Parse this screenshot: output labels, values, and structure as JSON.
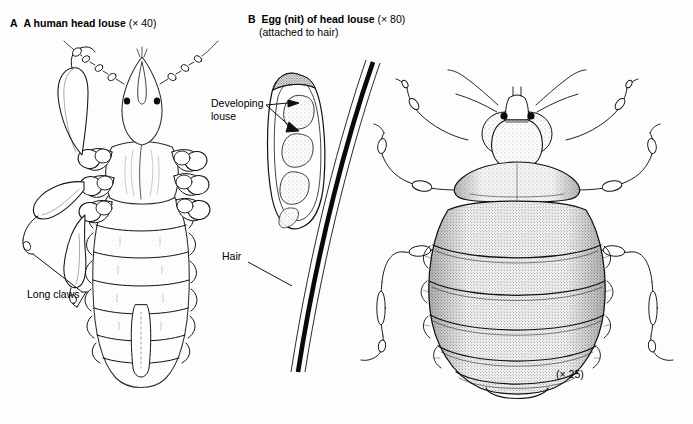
{
  "figure": {
    "background_color": "#fdfdfd",
    "ink_color": "#000000",
    "panels": [
      {
        "id": "A",
        "letter": "A",
        "title": "A human head louse",
        "magnification": "(× 40)",
        "subject": "human head louse",
        "annotations": [
          "Long claws"
        ]
      },
      {
        "id": "B",
        "letter": "B",
        "title": "Egg (nit) of head louse",
        "magnification": "(× 80)",
        "subtitle": "(attached to hair)",
        "subject": "egg (nit) attached to hair",
        "annotations": [
          "Developing louse",
          "Hair"
        ]
      },
      {
        "id": "C",
        "letter": "",
        "title": "",
        "magnification": "(× 25)",
        "subject": "bed bug",
        "annotations": []
      }
    ]
  },
  "captions": {
    "panel_a": {
      "letter": "A",
      "title": "A human head louse",
      "magnification": "(× 40)"
    },
    "panel_b": {
      "letter": "B",
      "title": "Egg (nit) of head louse",
      "magnification": "(× 80)",
      "subtitle": "(attached to hair)"
    }
  },
  "labels": {
    "developing_louse_line1": "Developing",
    "developing_louse_line2": "louse",
    "hair": "Hair",
    "long_claws": "Long claws",
    "magnification_bedbug": "(× 25)"
  }
}
